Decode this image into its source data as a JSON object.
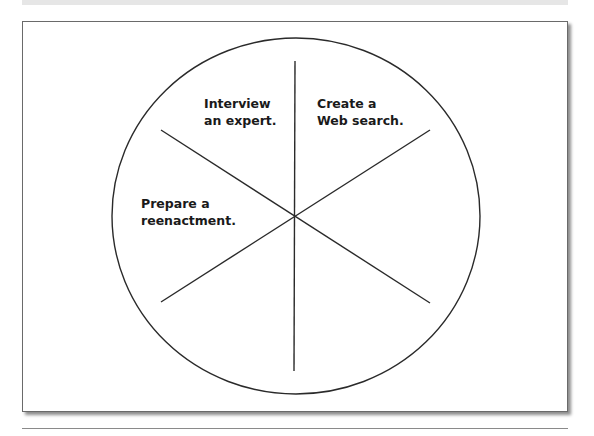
{
  "diagram": {
    "type": "wheel",
    "segments": 6,
    "colors": {
      "stroke": "#2a2a2a",
      "text": "#1a1a1a",
      "frame": "#6a6a6a"
    },
    "labels": [
      {
        "id": "interview",
        "line1": "Interview",
        "line2": "an expert."
      },
      {
        "id": "web-search",
        "line1": "Create a",
        "line2": "Web search."
      },
      {
        "id": "reenactment",
        "line1": "Prepare a",
        "line2": "reenactment."
      }
    ]
  }
}
